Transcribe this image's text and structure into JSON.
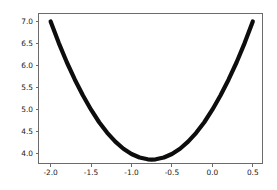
{
  "chart_data": {
    "type": "line",
    "title": "",
    "xlabel": "",
    "ylabel": "",
    "xlim": [
      -2.15,
      0.62
    ],
    "ylim": [
      3.78,
      7.18
    ],
    "grid": false,
    "legend": null,
    "line_color": "#0d0d0d",
    "line_width": 4.2,
    "background_color": "#ffffff",
    "axis_color": "#6b6b6b",
    "xticks": [
      -2.0,
      -1.5,
      -1.0,
      -0.5,
      0.0,
      0.5
    ],
    "xticklabels": [
      "-2.0",
      "-1.5",
      "-1.0",
      "-0.5",
      "0.0",
      "0.5"
    ],
    "yticks": [
      4.0,
      4.5,
      5.0,
      5.5,
      6.0,
      6.5,
      7.0
    ],
    "yticklabels": [
      "4.0",
      "4.5",
      "5.0",
      "5.5",
      "6.0",
      "6.5",
      "7.0"
    ],
    "series": [
      {
        "name": "curve",
        "x": [
          -2.0,
          -1.9,
          -1.8,
          -1.7,
          -1.6,
          -1.5,
          -1.4,
          -1.3,
          -1.2,
          -1.1,
          -1.0,
          -0.9,
          -0.8,
          -0.75,
          -0.7,
          -0.6,
          -0.5,
          -0.4,
          -0.3,
          -0.2,
          -0.1,
          0.0,
          0.1,
          0.2,
          0.3,
          0.4,
          0.5
        ],
        "y": [
          7.0,
          6.515,
          6.075,
          5.68,
          5.32,
          5.0,
          4.715,
          4.475,
          4.275,
          4.115,
          3.995,
          3.915,
          3.875,
          3.87,
          3.875,
          3.915,
          3.995,
          4.115,
          4.275,
          4.475,
          4.715,
          5.0,
          5.32,
          5.68,
          6.075,
          6.515,
          7.0
        ]
      }
    ]
  },
  "figure": {
    "label": "matplotlib-figure"
  }
}
